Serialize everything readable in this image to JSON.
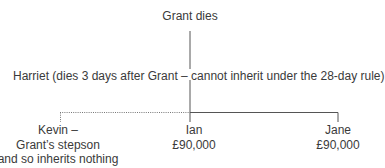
{
  "diagram": {
    "type": "family-inheritance-tree",
    "deceased": {
      "label": "Grant dies"
    },
    "spouse": {
      "label": "Harriet (dies 3 days after Grant – cannot inherit under the 28-day rule)"
    },
    "children": [
      {
        "name": "Kevin –",
        "lines": [
          "Grant’s stepson",
          "and so inherits nothing"
        ],
        "relationship": "stepson",
        "link_style": "dotted"
      },
      {
        "name": "Ian",
        "lines": [
          "£90,000"
        ],
        "relationship": "child",
        "link_style": "solid"
      },
      {
        "name": "Jane",
        "lines": [
          "£90,000"
        ],
        "relationship": "child",
        "link_style": "solid"
      }
    ],
    "colors": {
      "text": "#3a3a3a",
      "line": "#555555",
      "background": "#ffffff"
    }
  }
}
